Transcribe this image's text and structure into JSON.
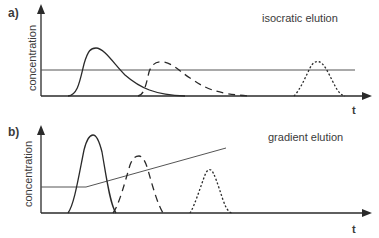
{
  "figure": {
    "panels": [
      {
        "id": "a",
        "label": "a)",
        "title": "isocratic elution",
        "ylabel": "concentration",
        "xlabel": "t",
        "solvent_profile": "constant",
        "peaks": [
          {
            "name": "peak-1",
            "style": "solid",
            "shape": "broad tailing"
          },
          {
            "name": "peak-2",
            "style": "dashed",
            "shape": "broad tailing"
          },
          {
            "name": "peak-3",
            "style": "dotted",
            "shape": "late narrow"
          }
        ]
      },
      {
        "id": "b",
        "label": "b)",
        "title": "gradient elution",
        "ylabel": "concentration",
        "xlabel": "t",
        "solvent_profile": "constant then linear ramp",
        "peaks": [
          {
            "name": "peak-1",
            "style": "solid",
            "shape": "sharp"
          },
          {
            "name": "peak-2",
            "style": "dashed",
            "shape": "sharp"
          },
          {
            "name": "peak-3",
            "style": "dotted",
            "shape": "sharp"
          }
        ]
      }
    ],
    "colors": {
      "ink": "#3a3a3a",
      "background": "#ffffff"
    }
  }
}
